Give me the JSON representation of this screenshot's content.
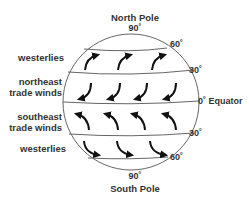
{
  "poles": {
    "north": "North Pole",
    "south": "South Pole"
  },
  "latitudes": {
    "north_90": "90˚",
    "north_60": "60˚",
    "north_30": "30˚",
    "equator": "0˚ Equator",
    "south_30": "30˚",
    "south_60": "60˚",
    "south_90": "90˚"
  },
  "wind_belts": [
    {
      "label": "westerlies",
      "hemisphere": "north",
      "band": "30-60",
      "direction": "curving up-right (toward northeast)"
    },
    {
      "label_line1": "northeast",
      "label_line2": "trade winds",
      "hemisphere": "north",
      "band": "0-30",
      "direction": "curving down-left (toward southwest)"
    },
    {
      "label_line1": "southeast",
      "label_line2": "trade winds",
      "hemisphere": "south",
      "band": "0-30",
      "direction": "curving up-left (toward northwest)"
    },
    {
      "label": "westerlies",
      "hemisphere": "south",
      "band": "30-60",
      "direction": "curving down-right (toward southeast)"
    }
  ],
  "colors": {
    "line": "#555555",
    "arrow": "#111111",
    "text": "#333333"
  }
}
